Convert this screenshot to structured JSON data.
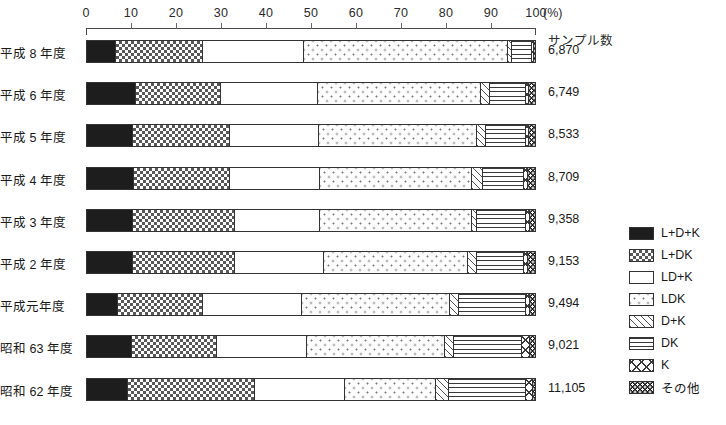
{
  "chart_data": {
    "type": "bar",
    "orientation": "horizontal",
    "stacked": true,
    "stacked_normalized": true,
    "title": "",
    "xlabel": "(%)",
    "ylabel": "",
    "xlim": [
      0,
      100
    ],
    "xticks": [
      0,
      10,
      20,
      30,
      40,
      50,
      60,
      70,
      80,
      90,
      100
    ],
    "xtick_labels": [
      "0",
      "10",
      "20",
      "30",
      "40",
      "50",
      "60",
      "70",
      "80",
      "90",
      "100"
    ],
    "grid": false,
    "legend_position": "right",
    "axis_unit_label": "(%)",
    "sample_column_header": "サンプル数",
    "categories": [
      "平成 8 年度",
      "平成 6 年度",
      "平成 5 年度",
      "平成 4 年度",
      "平成 3 年度",
      "平成 2 年度",
      "平成元年度",
      "昭和 63 年度",
      "昭和 62 年度"
    ],
    "sample_sizes": [
      "6,870",
      "6,749",
      "8,533",
      "8,709",
      "9,358",
      "9,153",
      "9,494",
      "9,021",
      "11,105"
    ],
    "series": [
      {
        "name": "L+D+K",
        "pattern": "solid-black",
        "values": [
          6.5,
          11.0,
          10.2,
          10.5,
          10.2,
          10.3,
          7.0,
          10.0,
          9.2
        ]
      },
      {
        "name": "L+DK",
        "pattern": "checkerboard",
        "values": [
          19.5,
          19.0,
          21.8,
          21.5,
          22.8,
          22.7,
          19.0,
          19.0,
          28.3
        ]
      },
      {
        "name": "LD+K",
        "pattern": "plain-white",
        "values": [
          22.5,
          21.5,
          19.8,
          20.0,
          19.0,
          20.0,
          22.0,
          20.0,
          20.0
        ]
      },
      {
        "name": "LDK",
        "pattern": "sparse-dots",
        "values": [
          45.5,
          36.5,
          35.2,
          34.0,
          34.0,
          32.0,
          33.0,
          31.0,
          20.5
        ]
      },
      {
        "name": "D+K",
        "pattern": "diagonal-hatch",
        "values": [
          0.8,
          2.0,
          2.0,
          2.3,
          1.0,
          2.0,
          2.0,
          2.0,
          2.7
        ]
      },
      {
        "name": "DK",
        "pattern": "horizontal-lines",
        "values": [
          4.6,
          8.0,
          9.0,
          9.2,
          11.0,
          10.5,
          15.0,
          15.0,
          17.3
        ]
      },
      {
        "name": "K",
        "pattern": "cross-hatch",
        "values": [
          0.3,
          0.7,
          0.7,
          1.0,
          1.0,
          1.0,
          1.0,
          2.0,
          1.5
        ]
      },
      {
        "name": "その他",
        "pattern": "dark-speckle",
        "values": [
          0.3,
          1.3,
          1.3,
          1.5,
          1.0,
          1.5,
          1.0,
          1.0,
          0.5
        ]
      }
    ]
  },
  "legend": {
    "items": [
      {
        "label": "L+D+K",
        "pattern": "solid-black"
      },
      {
        "label": "L+DK",
        "pattern": "checkerboard"
      },
      {
        "label": "LD+K",
        "pattern": "plain-white"
      },
      {
        "label": "LDK",
        "pattern": "sparse-dots"
      },
      {
        "label": "D+K",
        "pattern": "diagonal-hatch"
      },
      {
        "label": "DK",
        "pattern": "horizontal-lines"
      },
      {
        "label": "K",
        "pattern": "cross-hatch"
      },
      {
        "label": "その他",
        "pattern": "dark-speckle"
      }
    ]
  },
  "colors": {
    "ink": "#1a1a1a",
    "axis": "#4a4a4a",
    "background": "#ffffff"
  }
}
